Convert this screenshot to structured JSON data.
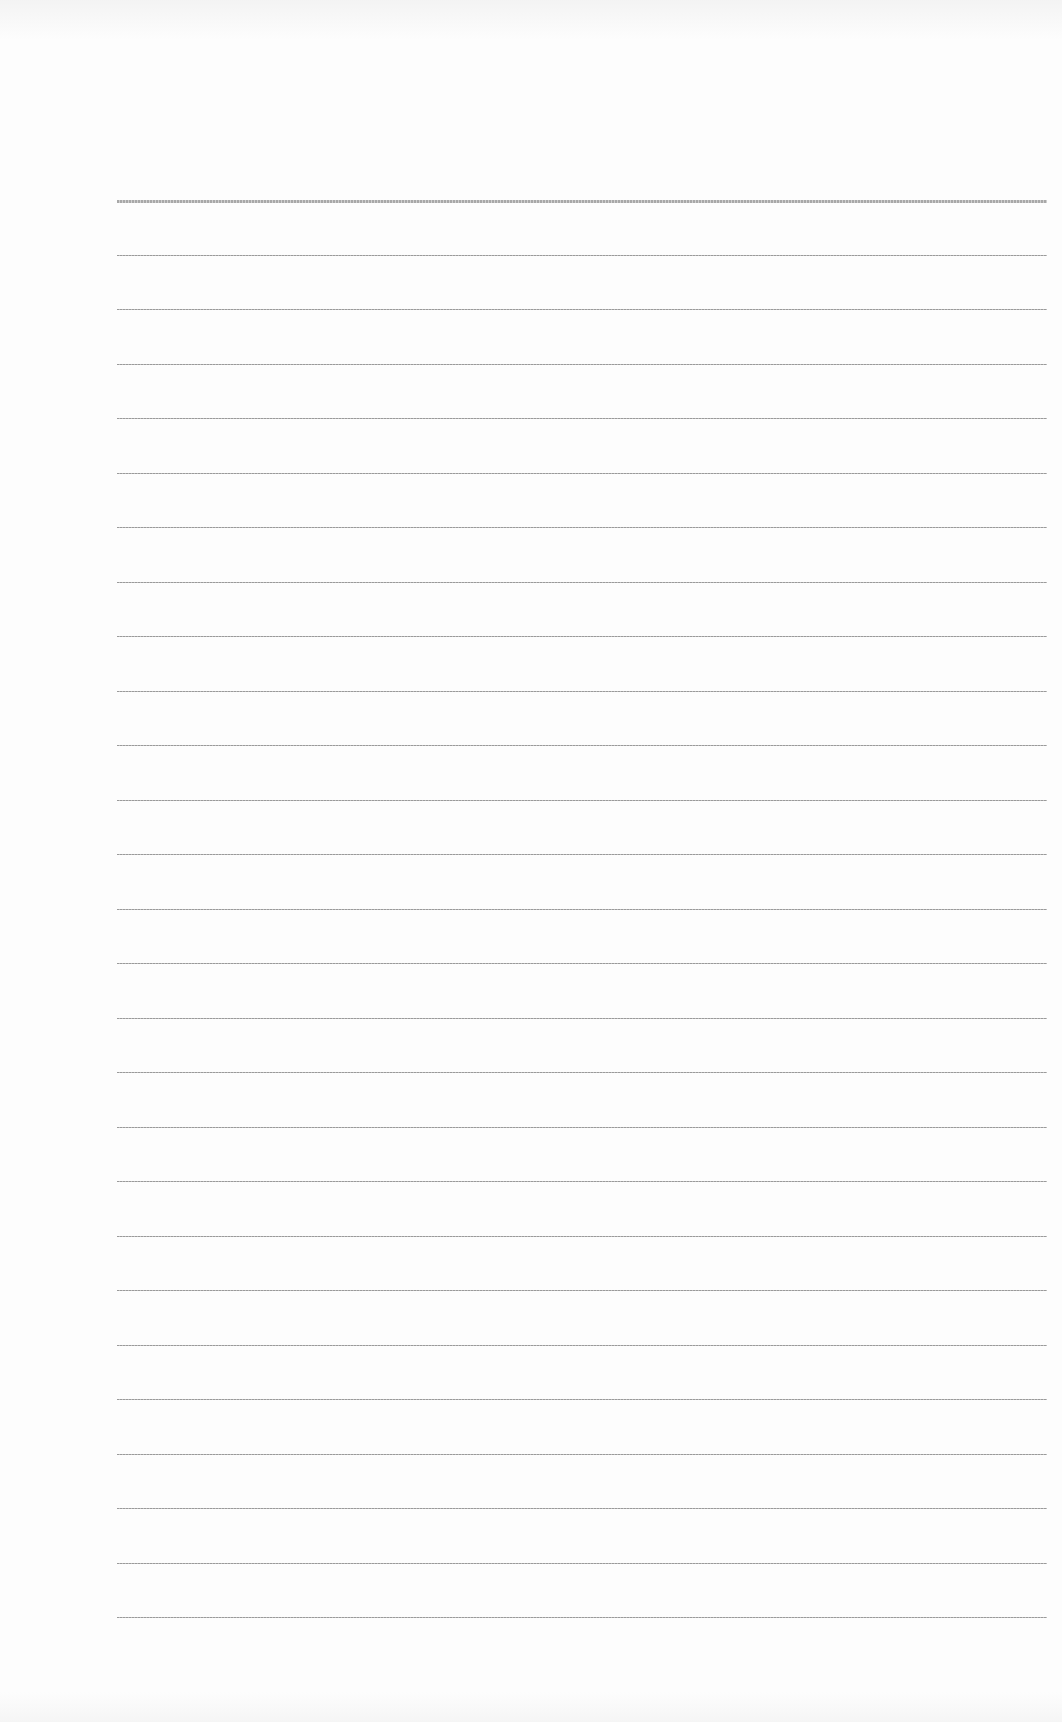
{
  "page": {
    "type": "lined-paper",
    "background": "#fdfdfd",
    "line_color": "#a0a0a0",
    "line_count": 27,
    "first_line_y": 200,
    "line_spacing": 54.5,
    "line_left": 117,
    "line_right": 1047,
    "text": ""
  }
}
